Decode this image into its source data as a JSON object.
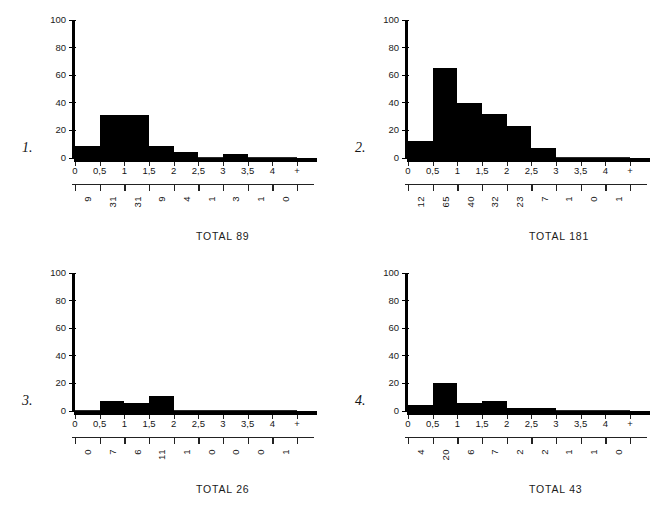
{
  "figure": {
    "panel_count": 4,
    "axis_color": "#000000",
    "bar_color": "#000000",
    "background": "#ffffff"
  },
  "shared": {
    "y_ticks": [
      "0",
      "20",
      "40",
      "60",
      "80",
      "100"
    ],
    "x_ticks": [
      "0",
      "0,5",
      "1",
      "1,5",
      "2",
      "2,5",
      "3",
      "3,5",
      "4",
      "+"
    ],
    "total_prefix": "TOTAL"
  },
  "chart_data": [
    {
      "type": "bar",
      "panel_label": "1.",
      "title": "",
      "xlabel": "",
      "ylabel": "",
      "ylim": [
        0,
        100
      ],
      "grid": false,
      "legend": "none",
      "bin_edges": [
        "0",
        "0,5",
        "1",
        "1,5",
        "2",
        "2,5",
        "3",
        "3,5",
        "4",
        "+"
      ],
      "categories": [
        "0-0,5",
        "0,5-1",
        "1-1,5",
        "1,5-2",
        "2-2,5",
        "2,5-3",
        "3-3,5",
        "3,5-4",
        "4-+"
      ],
      "values": [
        9,
        31,
        31,
        9,
        4,
        1,
        3,
        1,
        0
      ],
      "tick_labels": [
        "9",
        "31",
        "31",
        "9",
        "4",
        "1",
        "3",
        "1",
        "0"
      ],
      "total": "TOTAL 89"
    },
    {
      "type": "bar",
      "panel_label": "2.",
      "title": "",
      "xlabel": "",
      "ylabel": "",
      "ylim": [
        0,
        100
      ],
      "grid": false,
      "legend": "none",
      "bin_edges": [
        "0",
        "0,5",
        "1",
        "1,5",
        "2",
        "2,5",
        "3",
        "3,5",
        "4",
        "+"
      ],
      "categories": [
        "0-0,5",
        "0,5-1",
        "1-1,5",
        "1,5-2",
        "2-2,5",
        "2,5-3",
        "3-3,5",
        "3,5-4",
        "4-+"
      ],
      "values": [
        12,
        65,
        40,
        32,
        23,
        7,
        1,
        0,
        1
      ],
      "tick_labels": [
        "12",
        "65",
        "40",
        "32",
        "23",
        "7",
        "1",
        "0",
        "1"
      ],
      "total": "TOTAL 181"
    },
    {
      "type": "bar",
      "panel_label": "3.",
      "title": "",
      "xlabel": "",
      "ylabel": "",
      "ylim": [
        0,
        100
      ],
      "grid": false,
      "legend": "none",
      "bin_edges": [
        "0",
        "0,5",
        "1",
        "1,5",
        "2",
        "2,5",
        "3",
        "3,5",
        "4",
        "+"
      ],
      "categories": [
        "0-0,5",
        "0,5-1",
        "1-1,5",
        "1,5-2",
        "2-2,5",
        "2,5-3",
        "3-3,5",
        "3,5-4",
        "4-+"
      ],
      "values": [
        0,
        7,
        6,
        11,
        1,
        0,
        0,
        0,
        1
      ],
      "tick_labels": [
        "0",
        "7",
        "6",
        "11",
        "1",
        "0",
        "0",
        "0",
        "1"
      ],
      "total": "TOTAL 26"
    },
    {
      "type": "bar",
      "panel_label": "4.",
      "title": "",
      "xlabel": "",
      "ylabel": "",
      "ylim": [
        0,
        100
      ],
      "grid": false,
      "legend": "none",
      "bin_edges": [
        "0",
        "0,5",
        "1",
        "1,5",
        "2",
        "2,5",
        "3",
        "3,5",
        "4",
        "+"
      ],
      "categories": [
        "0-0,5",
        "0,5-1",
        "1-1,5",
        "1,5-2",
        "2-2,5",
        "2,5-3",
        "3-3,5",
        "3,5-4",
        "4-+"
      ],
      "values": [
        4,
        20,
        6,
        7,
        2,
        2,
        1,
        1,
        0
      ],
      "tick_labels": [
        "4",
        "20",
        "6",
        "7",
        "2",
        "2",
        "1",
        "1",
        "0"
      ],
      "total": "TOTAL 43"
    }
  ]
}
